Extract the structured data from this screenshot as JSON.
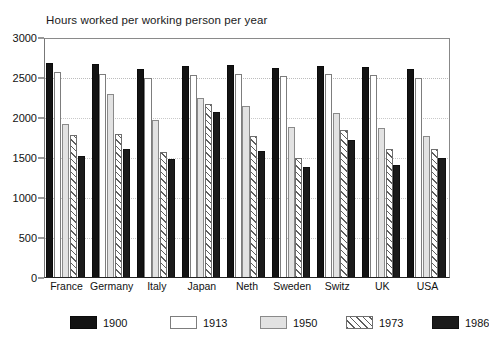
{
  "chart_data": {
    "type": "bar",
    "title": "Hours worked per working person per year",
    "xlabel": "",
    "ylabel": "",
    "ylim": [
      0,
      3000
    ],
    "yticks": [
      0,
      500,
      1000,
      1500,
      2000,
      2500,
      3000
    ],
    "ytick_labels": [
      "0",
      "500",
      "1000",
      "1500",
      "2000",
      "2500",
      "3000"
    ],
    "grid": true,
    "legend_position": "bottom",
    "categories": [
      "France",
      "Germany",
      "Italy",
      "Japan",
      "Neth",
      "Sweden",
      "Switz",
      "UK",
      "USA"
    ],
    "series": [
      {
        "name": "1900",
        "fill": "solid-black",
        "values": [
          2690,
          2670,
          2610,
          2655,
          2660,
          2625,
          2650,
          2640,
          2610
        ]
      },
      {
        "name": "1913",
        "fill": "white",
        "values": [
          2580,
          2555,
          2505,
          2540,
          2550,
          2520,
          2545,
          2535,
          2505
        ]
      },
      {
        "name": "1950",
        "fill": "light-gray",
        "values": [
          1925,
          2300,
          1975,
          2250,
          2155,
          1890,
          2065,
          1880,
          1775
        ]
      },
      {
        "name": "1973",
        "fill": "diagonal-hatch",
        "values": [
          1785,
          1800,
          1580,
          2180,
          1780,
          1500,
          1855,
          1615,
          1610
        ]
      },
      {
        "name": "1986",
        "fill": "solid-black",
        "values": [
          1525,
          1610,
          1490,
          2080,
          1590,
          1390,
          1730,
          1415,
          1500
        ]
      }
    ]
  },
  "legend": {
    "items": [
      {
        "label": "1900",
        "swatch": "solid-black"
      },
      {
        "label": "1913",
        "swatch": "white"
      },
      {
        "label": "1950",
        "swatch": "light-gray"
      },
      {
        "label": "1973",
        "swatch": "diagonal-hatch"
      },
      {
        "label": "1986",
        "swatch": "solid-black"
      }
    ]
  },
  "colors": {
    "series_1900": "#131313",
    "series_1913": "#ffffff",
    "series_1950": "#e2e2e2",
    "series_1973": "#ffffff",
    "series_1986": "#1b1b1b",
    "axis": "#222222",
    "grid": "#c9c9c9"
  }
}
